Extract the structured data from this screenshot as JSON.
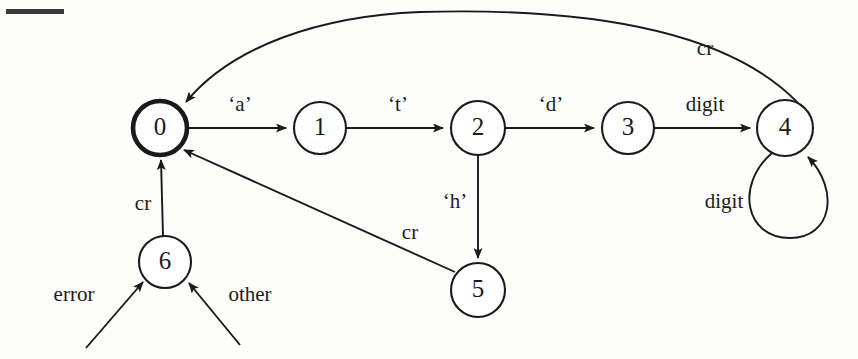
{
  "diagram": {
    "type": "finite-state-machine",
    "canvas": {
      "width": 858,
      "height": 359
    },
    "states": [
      {
        "id": "0",
        "label": "0",
        "cx": 160,
        "cy": 128,
        "r": 27,
        "accepting": true
      },
      {
        "id": "1",
        "label": "1",
        "cx": 320,
        "cy": 128,
        "r": 26,
        "accepting": false
      },
      {
        "id": "2",
        "label": "2",
        "cx": 478,
        "cy": 128,
        "r": 27,
        "accepting": false
      },
      {
        "id": "3",
        "label": "3",
        "cx": 628,
        "cy": 128,
        "r": 26,
        "accepting": false
      },
      {
        "id": "4",
        "label": "4",
        "cx": 785,
        "cy": 128,
        "r": 28,
        "accepting": false
      },
      {
        "id": "5",
        "label": "5",
        "cx": 478,
        "cy": 290,
        "r": 27,
        "accepting": false
      },
      {
        "id": "6",
        "label": "6",
        "cx": 165,
        "cy": 262,
        "r": 26,
        "accepting": false
      }
    ],
    "transitions": [
      {
        "from": "0",
        "to": "1",
        "label": "‘a’",
        "label_x": 240,
        "label_y": 106
      },
      {
        "from": "1",
        "to": "2",
        "label": "‘t’",
        "label_x": 398,
        "label_y": 106
      },
      {
        "from": "2",
        "to": "3",
        "label": "‘d’",
        "label_x": 551,
        "label_y": 106
      },
      {
        "from": "3",
        "to": "4",
        "label": "digit",
        "label_x": 705,
        "label_y": 106
      },
      {
        "from": "4",
        "to": "4",
        "label": "digit",
        "label_x": 724,
        "label_y": 203,
        "self_loop": true
      },
      {
        "from": "4",
        "to": "0",
        "label": "cr",
        "label_x": 705,
        "label_y": 50,
        "curved": true
      },
      {
        "from": "2",
        "to": "5",
        "label": "‘h’",
        "label_x": 455,
        "label_y": 203
      },
      {
        "from": "5",
        "to": "0",
        "label": "cr",
        "label_x": 410,
        "label_y": 234
      },
      {
        "from": "6",
        "to": "0",
        "label": "cr",
        "label_x": 143,
        "label_y": 205
      }
    ],
    "external_inputs": [
      {
        "to": "6",
        "label": "error",
        "label_x": 74,
        "label_y": 296
      },
      {
        "to": "6",
        "label": "other",
        "label_x": 250,
        "label_y": 296
      }
    ]
  }
}
